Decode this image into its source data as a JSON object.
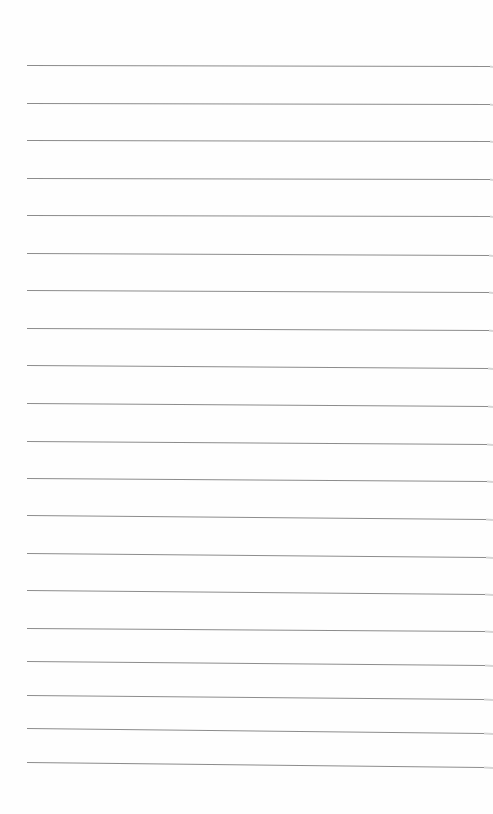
{
  "page": {
    "type": "blank lined paper",
    "background_color": "#fefefe",
    "rule_color": "#8c8c8c",
    "edge_shadow_color": "#d6d6d6",
    "rule_count": 20,
    "rules": [
      {
        "x1": 27,
        "y1": 65,
        "x2": 490,
        "y2": 66
      },
      {
        "x1": 27,
        "y1": 103,
        "x2": 490,
        "y2": 104
      },
      {
        "x1": 27,
        "y1": 140,
        "x2": 490,
        "y2": 141
      },
      {
        "x1": 27,
        "y1": 178,
        "x2": 490,
        "y2": 179
      },
      {
        "x1": 27,
        "y1": 215,
        "x2": 490,
        "y2": 216
      },
      {
        "x1": 27,
        "y1": 253,
        "x2": 489,
        "y2": 255
      },
      {
        "x1": 27,
        "y1": 290,
        "x2": 489,
        "y2": 292
      },
      {
        "x1": 27,
        "y1": 328,
        "x2": 489,
        "y2": 330
      },
      {
        "x1": 27,
        "y1": 365,
        "x2": 488,
        "y2": 368
      },
      {
        "x1": 27,
        "y1": 403,
        "x2": 488,
        "y2": 406
      },
      {
        "x1": 27,
        "y1": 441,
        "x2": 487,
        "y2": 444
      },
      {
        "x1": 27,
        "y1": 478,
        "x2": 487,
        "y2": 481
      },
      {
        "x1": 27,
        "y1": 515,
        "x2": 486,
        "y2": 519
      },
      {
        "x1": 27,
        "y1": 553,
        "x2": 486,
        "y2": 557
      },
      {
        "x1": 27,
        "y1": 590,
        "x2": 485,
        "y2": 594
      },
      {
        "x1": 27,
        "y1": 628,
        "x2": 485,
        "y2": 631
      },
      {
        "x1": 27,
        "y1": 661,
        "x2": 485,
        "y2": 665
      },
      {
        "x1": 27,
        "y1": 695,
        "x2": 484,
        "y2": 699
      },
      {
        "x1": 27,
        "y1": 728,
        "x2": 484,
        "y2": 733
      },
      {
        "x1": 27,
        "y1": 762,
        "x2": 484,
        "y2": 767
      }
    ]
  }
}
